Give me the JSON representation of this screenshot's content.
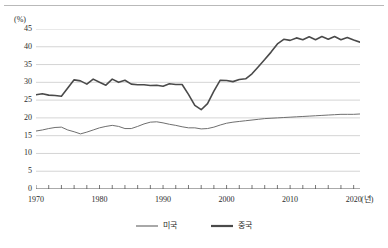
{
  "chart_data": {
    "type": "line",
    "title": "",
    "subtitle": "",
    "xlabel": "(년)",
    "ylabel": "(%)",
    "xlim": [
      1970,
      2021
    ],
    "ylim": [
      0,
      45
    ],
    "grid": true,
    "grid_axis": "y",
    "legend_position": "bottom-center",
    "y_ticks": [
      "45",
      "40",
      "35",
      "30",
      "25",
      "20",
      "15",
      "10",
      "5",
      "0"
    ],
    "y_tick_values": [
      45,
      40,
      35,
      30,
      25,
      20,
      15,
      10,
      5,
      0
    ],
    "x_ticks": [
      "1970",
      "1980",
      "1990",
      "2000",
      "2010",
      "2020"
    ],
    "x_tick_values": [
      1970,
      1980,
      1990,
      2000,
      2010,
      2020
    ],
    "x_minor_tick_step": 2,
    "x": [
      1970,
      1971,
      1972,
      1973,
      1974,
      1975,
      1976,
      1977,
      1978,
      1979,
      1980,
      1981,
      1982,
      1983,
      1984,
      1985,
      1986,
      1987,
      1988,
      1989,
      1990,
      1991,
      1992,
      1993,
      1994,
      1995,
      1996,
      1997,
      1998,
      1999,
      2000,
      2001,
      2002,
      2003,
      2004,
      2005,
      2006,
      2007,
      2008,
      2009,
      2010,
      2011,
      2012,
      2013,
      2014,
      2015,
      2016,
      2017,
      2018,
      2019,
      2020,
      2021
    ],
    "series": [
      {
        "name": "미국",
        "color": "#6f6f6f",
        "line_width": 1.0,
        "values": [
          16.3,
          16.6,
          17.0,
          17.3,
          17.4,
          16.6,
          16.1,
          15.5,
          16.0,
          16.6,
          17.2,
          17.6,
          17.9,
          17.6,
          17.0,
          17.0,
          17.6,
          18.3,
          18.8,
          18.9,
          18.6,
          18.2,
          17.9,
          17.5,
          17.2,
          17.2,
          16.9,
          17.0,
          17.4,
          18.0,
          18.5,
          18.8,
          19.0,
          19.2,
          19.4,
          19.6,
          19.8,
          19.9,
          20.0,
          20.1,
          20.2,
          20.3,
          20.4,
          20.5,
          20.6,
          20.7,
          20.8,
          20.9,
          21.0,
          21.0,
          21.0,
          21.1
        ]
      },
      {
        "name": "중국",
        "color": "#4a4a4a",
        "line_width": 1.6,
        "values": [
          26.5,
          26.8,
          26.4,
          26.3,
          26.1,
          28.4,
          30.7,
          30.4,
          29.5,
          30.9,
          30.0,
          29.2,
          30.9,
          30.0,
          30.6,
          29.5,
          29.3,
          29.3,
          29.1,
          29.2,
          28.9,
          29.6,
          29.4,
          29.4,
          26.6,
          23.5,
          22.3,
          24.0,
          27.5,
          30.6,
          30.5,
          30.2,
          30.8,
          31.0,
          32.4,
          34.4,
          36.4,
          38.5,
          40.8,
          42.1,
          41.8,
          42.5,
          42.0,
          42.8,
          42.0,
          42.9,
          42.1,
          42.9,
          42.0,
          42.6,
          41.9,
          41.3
        ]
      }
    ]
  },
  "legend": {
    "items": [
      {
        "label": "미국",
        "color": "#6f6f6f",
        "thickness": 1
      },
      {
        "label": "중국",
        "color": "#4a4a4a",
        "thickness": 2
      }
    ]
  }
}
